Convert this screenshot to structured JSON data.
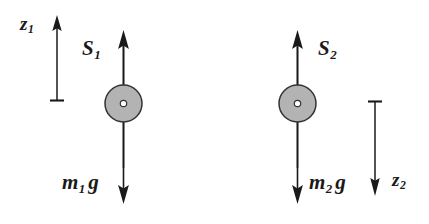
{
  "figure": {
    "background_color": "#ffffff",
    "stroke_color": "#1a1a1a",
    "mass_fill_color": "#b3b3b3",
    "hub_fill_color": "#ffffff",
    "width": 429,
    "height": 224
  },
  "labels": {
    "z1": {
      "var": "z",
      "sub": "1"
    },
    "s1": {
      "var": "S",
      "sub": "1"
    },
    "m1g": {
      "var": "m",
      "sub": "1",
      "tail": "g"
    },
    "s2": {
      "var": "S",
      "sub": "2"
    },
    "m2g": {
      "var": "m",
      "sub": "2",
      "tail": "g"
    },
    "z2": {
      "var": "z",
      "sub": "2"
    }
  },
  "bodies": [
    {
      "name": "mass-1",
      "center_x": 123.5,
      "center_y": 103.5,
      "radius": 18.5,
      "hub_radius": 3.2,
      "tension_label": "S_1",
      "weight_label": "m_1 g",
      "tension_direction": "up",
      "weight_direction": "down"
    },
    {
      "name": "mass-2",
      "center_x": 297.5,
      "center_y": 103.5,
      "radius": 18.5,
      "hub_radius": 3.2,
      "tension_label": "S_2",
      "weight_label": "m_2 g",
      "tension_direction": "up",
      "weight_direction": "down"
    }
  ],
  "axes": [
    {
      "name": "z1-axis",
      "label": "z_1",
      "direction": "up",
      "x": 57,
      "origin_y": 100,
      "tip_y": 16,
      "tick_half_width": 7
    },
    {
      "name": "z2-axis",
      "label": "z_2",
      "direction": "down",
      "x": 375,
      "origin_y": 101,
      "tip_y": 196,
      "tick_half_width": 7
    }
  ],
  "force_arrows": [
    {
      "name": "tension-1",
      "x": 123.5,
      "from_y": 168,
      "to_y": 32,
      "direction": "up"
    },
    {
      "name": "weight-1",
      "x": 123.5,
      "from_y": 40,
      "to_y": 203,
      "direction": "down"
    },
    {
      "name": "tension-2",
      "x": 297.5,
      "from_y": 168,
      "to_y": 32,
      "direction": "up"
    },
    {
      "name": "weight-2",
      "x": 297.5,
      "from_y": 40,
      "to_y": 203,
      "direction": "down"
    }
  ]
}
